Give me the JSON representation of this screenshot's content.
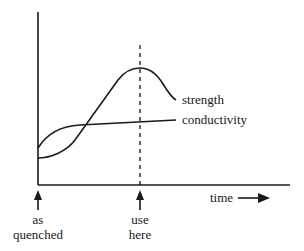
{
  "diagram": {
    "type": "property-vs-time schematic",
    "curves": [
      {
        "name": "strength",
        "label": "strength"
      },
      {
        "name": "conductivity",
        "label": "conductivity"
      }
    ],
    "axis": {
      "x_label": "time",
      "x_direction_arrow": "right-arrow"
    },
    "markers": [
      {
        "name": "as-quenched",
        "line1": "as",
        "line2": "quenched"
      },
      {
        "name": "use-here",
        "line1": "use",
        "line2": "here"
      }
    ],
    "colors": {
      "ink": "#1a1a1a",
      "background": "#ffffff"
    }
  }
}
